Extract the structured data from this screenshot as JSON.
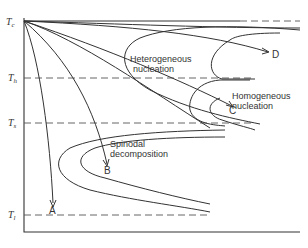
{
  "diagram": {
    "type": "time-temperature-transformation",
    "axes": {
      "y_axis": "temperature",
      "x_axis": "time"
    },
    "temperature_levels": [
      {
        "symbol": "T",
        "sub": "c",
        "y": 21
      },
      {
        "symbol": "T",
        "sub": "h",
        "y": 78
      },
      {
        "symbol": "T",
        "sub": "s",
        "y": 123
      },
      {
        "symbol": "T",
        "sub": "l",
        "y": 215
      }
    ],
    "regions": {
      "heterogeneous": "Heterogeneous",
      "heterogeneous2": "nucleation",
      "homogeneous": "Homogeneous",
      "homogeneous2": "nucleation",
      "spinodal": "Spinodal",
      "spinodal2": "decomposition"
    },
    "paths": {
      "A": "A",
      "B": "B",
      "C": "C",
      "D": "D"
    }
  }
}
